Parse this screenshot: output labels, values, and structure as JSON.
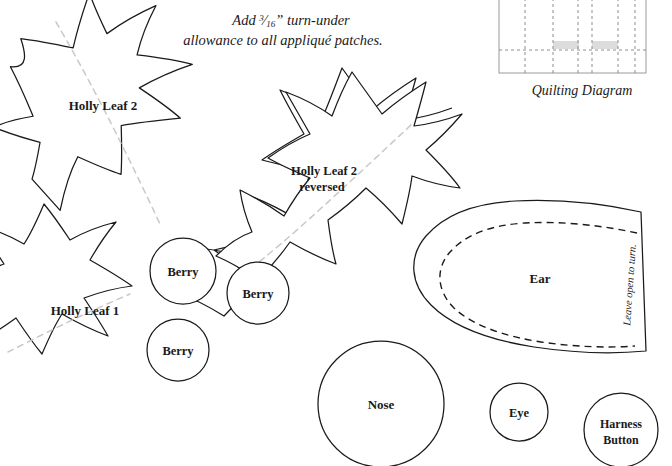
{
  "document": {
    "type": "applique-pattern-sheet",
    "background_color": "#ffffff",
    "ink_color": "#1a1a1a",
    "vein_color": "#c9c9c9",
    "diagram_block_color": "#dcdcdc"
  },
  "instruction": {
    "line1_prefix": "Add ",
    "fraction_numerator": "3",
    "fraction_denominator": "16",
    "line1_suffix": "” turn-under",
    "line2": "allowance to all appliqué patches.",
    "full_text": "Add 3/16” turn-under allowance to all appliqué patches."
  },
  "quilting_diagram": {
    "caption": "Quilting Diagram"
  },
  "pieces": [
    {
      "id": "holly-leaf-2",
      "label": "Holly Leaf 2",
      "label_lines": [
        "Holly Leaf 2"
      ]
    },
    {
      "id": "holly-leaf-2-reversed",
      "label": "Holly Leaf 2 reversed",
      "label_lines": [
        "Holly Leaf 2",
        "reversed"
      ]
    },
    {
      "id": "holly-leaf-1",
      "label": "Holly Leaf 1",
      "label_lines": [
        "Holly Leaf 1"
      ]
    },
    {
      "id": "berry-1",
      "label": "Berry"
    },
    {
      "id": "berry-2",
      "label": "Berry"
    },
    {
      "id": "berry-3",
      "label": "Berry"
    },
    {
      "id": "ear",
      "label": "Ear",
      "note": "Leave open to turn."
    },
    {
      "id": "nose",
      "label": "Nose"
    },
    {
      "id": "eye",
      "label": "Eye"
    },
    {
      "id": "harness-button",
      "label_lines": [
        "Harness",
        "Button"
      ],
      "label": "Harness Button"
    }
  ],
  "labels": {
    "holly_leaf_2": "Holly Leaf 2",
    "holly_leaf_2_reversed_line1": "Holly Leaf 2",
    "holly_leaf_2_reversed_line2": "reversed",
    "holly_leaf_1": "Holly Leaf 1",
    "berry_1": "Berry",
    "berry_2": "Berry",
    "berry_3": "Berry",
    "ear": "Ear",
    "ear_note": "Leave open to turn.",
    "nose": "Nose",
    "eye": "Eye",
    "harness_button_line1": "Harness",
    "harness_button_line2": "Button"
  }
}
